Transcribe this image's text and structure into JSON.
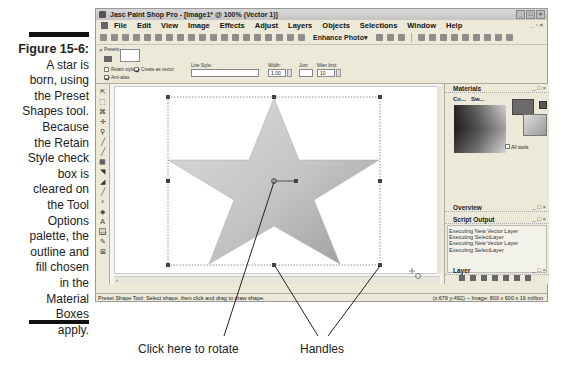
{
  "caption": {
    "figure_label": "Figure 15-6:",
    "lines": [
      "A star is",
      "born, using",
      "the Preset",
      "Shapes tool.",
      "Because",
      "the Retain",
      "Style check",
      "box is",
      "cleared on",
      "the Tool",
      "Options",
      "palette, the",
      "outline and",
      "fill chosen",
      "in the",
      "Material",
      "Boxes",
      "apply."
    ]
  },
  "window": {
    "title": "Jasc Paint Shop Pro - [Image1* @ 100% (Vector 1)]",
    "controls": [
      "minimize",
      "maximize",
      "close"
    ]
  },
  "menubar": {
    "items": [
      "File",
      "Edit",
      "View",
      "Image",
      "Effects",
      "Adjust",
      "Layers",
      "Objects",
      "Selections",
      "Window",
      "Help"
    ]
  },
  "toolbar": {
    "enhance_photo_label": "Enhance Photo",
    "enhance_photo_arrow": "▾"
  },
  "tool_options": {
    "presets_label": "Presets:",
    "retain_style_label": "Retain style",
    "retain_style_checked": false,
    "create_as_vector_label": "Create as vector",
    "create_as_vector_checked": true,
    "anti_alias_label": "Anti-alias",
    "anti_alias_checked": true,
    "line_style_label": "Line Style:",
    "width_label": "Width:",
    "width_value": "1.00",
    "join_label": "Join:",
    "miter_limit_label": "Miter limit:",
    "miter_limit_value": "10"
  },
  "palettes": {
    "materials": {
      "title": "Materials",
      "tabs": [
        "Co...",
        "Sw..."
      ],
      "all_tools_label": "All tools",
      "colors": {
        "foreground": "#6a6a6a",
        "background": "#bbbbbb"
      }
    },
    "overview": {
      "title": "Overview"
    },
    "script_output": {
      "title": "Script Output",
      "lines": [
        "Executing New Vector Layer",
        "Executing SelectLayer",
        "Executing New Vector Layer",
        "Executing SelectLayer"
      ]
    },
    "layer": {
      "title": "Layer"
    }
  },
  "statusbar": {
    "hint": "Preset Shape Tool: Select shape, then click and drag to draw shape.",
    "info": "(x:679 y:492) -- Image: 800 x 600 x 16 million"
  },
  "annotations": {
    "rotate": "Click here to rotate",
    "handles": "Handles"
  }
}
